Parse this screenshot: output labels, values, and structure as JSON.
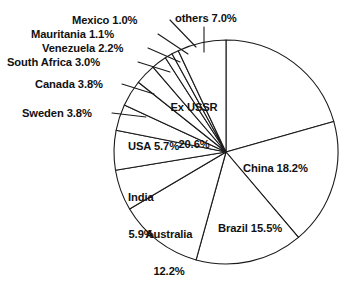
{
  "chart_data": {
    "type": "pie",
    "title": "",
    "subtitle": "",
    "xlabel": "",
    "ylabel": "",
    "legend": "none",
    "grid": false,
    "units": "percent",
    "start_angle_deg": 0,
    "direction": "clockwise",
    "total": 100.0,
    "categories": [
      "Ex USSR",
      "China",
      "Brazil",
      "Australia",
      "India",
      "USA",
      "Sweden",
      "Canada",
      "South Africa",
      "Venezuela",
      "Mauritania",
      "Mexico",
      "others"
    ],
    "values": [
      20.6,
      18.2,
      15.5,
      12.2,
      5.9,
      5.7,
      3.8,
      3.8,
      3.0,
      2.2,
      1.1,
      1.0,
      7.0
    ],
    "slices": [
      {
        "name": "Ex USSR",
        "value": 20.6,
        "label": "Ex USSR\n20.6%",
        "label_text": "Ex USSR 20.6%",
        "placement": "inside"
      },
      {
        "name": "China",
        "value": 18.2,
        "label": "China 18.2%",
        "label_text": "China 18.2%",
        "placement": "inside"
      },
      {
        "name": "Brazil",
        "value": 15.5,
        "label": "Brazil 15.5%",
        "label_text": "Brazil 15.5%",
        "placement": "inside"
      },
      {
        "name": "Australia",
        "value": 12.2,
        "label": "Australia\n12.2%",
        "label_text": "Australia 12.2%",
        "placement": "inside"
      },
      {
        "name": "India",
        "value": 5.9,
        "label": "India\n5.9%",
        "label_text": "India 5.9%",
        "placement": "inside"
      },
      {
        "name": "USA",
        "value": 5.7,
        "label": "USA 5.7%",
        "label_text": "USA 5.7%",
        "placement": "inside"
      },
      {
        "name": "Sweden",
        "value": 3.8,
        "label": "Sweden 3.8%",
        "label_text": "Sweden 3.8%",
        "placement": "outside-left"
      },
      {
        "name": "Canada",
        "value": 3.8,
        "label": "Canada 3.8%",
        "label_text": "Canada 3.8%",
        "placement": "outside-left"
      },
      {
        "name": "South Africa",
        "value": 3.0,
        "label": "South Africa 3.0%",
        "label_text": "South Africa 3.0%",
        "placement": "outside-left"
      },
      {
        "name": "Venezuela",
        "value": 2.2,
        "label": "Venezuela 2.2%",
        "label_text": "Venezuela 2.2%",
        "placement": "outside-left"
      },
      {
        "name": "Mauritania",
        "value": 1.1,
        "label": "Mauritania 1.1%",
        "label_text": "Mauritania 1.1%",
        "placement": "outside-left"
      },
      {
        "name": "Mexico",
        "value": 1.0,
        "label": "Mexico 1.0%",
        "label_text": "Mexico 1.0%",
        "placement": "outside-left"
      },
      {
        "name": "others",
        "value": 7.0,
        "label": "others 7.0%",
        "label_text": "others 7.0%",
        "placement": "outside-top"
      }
    ],
    "colors": {
      "slice_fill": "#ffffff",
      "slice_stroke": "#1a1a1a",
      "label_text": "#111111",
      "background": "#ffffff"
    },
    "geometry": {
      "center_x": 226,
      "center_y": 152,
      "radius": 112
    }
  },
  "labels": {
    "ex_ussr_line1": "Ex USSR",
    "ex_ussr_line2": "20.6%",
    "china": "China 18.2%",
    "brazil": "Brazil 15.5%",
    "australia_line1": "Australia",
    "australia_line2": "12.2%",
    "india_line1": "India",
    "india_line2": "5.9%",
    "usa": "USA 5.7%",
    "sweden": "Sweden 3.8%",
    "canada": "Canada 3.8%",
    "south_africa": "South Africa 3.0%",
    "venezuela": "Venezuela 2.2%",
    "mauritania": "Mauritania 1.1%",
    "mexico": "Mexico 1.0%",
    "others": "others 7.0%"
  }
}
